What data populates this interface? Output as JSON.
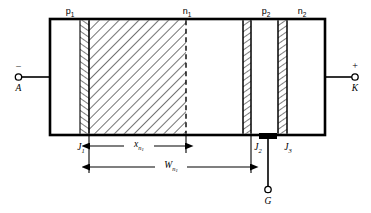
{
  "figure": {
    "colors": {
      "outline": "#000000",
      "hatch": "#000000",
      "background": "#ffffff",
      "contact": "#000000"
    },
    "layers": [
      {
        "id": "p1",
        "base": "p",
        "sub": "1"
      },
      {
        "id": "n1",
        "base": "n",
        "sub": "1"
      },
      {
        "id": "p2",
        "base": "p",
        "sub": "2"
      },
      {
        "id": "n2",
        "base": "n",
        "sub": "2"
      }
    ],
    "junctions": [
      {
        "id": "J1",
        "base": "J",
        "sub": "1"
      },
      {
        "id": "J2",
        "base": "J",
        "sub": "2"
      },
      {
        "id": "J3",
        "base": "J",
        "sub": "3"
      }
    ],
    "terminals": [
      {
        "id": "A",
        "label": "A",
        "polarity": "−",
        "name": "anode"
      },
      {
        "id": "K",
        "label": "K",
        "polarity": "+",
        "name": "cathode"
      },
      {
        "id": "G",
        "label": "G",
        "polarity": "",
        "name": "gate"
      }
    ],
    "dimensions": [
      {
        "id": "xn1",
        "base": "x",
        "sub": "n",
        "subsub": "1"
      },
      {
        "id": "Wn1",
        "base": "W",
        "sub": "n",
        "subsub": "1"
      }
    ]
  }
}
